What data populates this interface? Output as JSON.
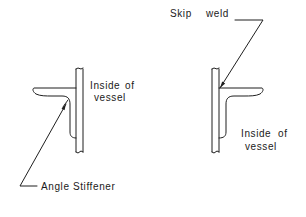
{
  "diagram": {
    "left_detail": {
      "label_inside": [
        "Inside",
        "of"
      ],
      "label_vessel": "vessel",
      "callout": "Angle Stiffener"
    },
    "right_detail": {
      "callout": "Skip",
      "callout_2": "weld",
      "label_inside": [
        "Inside",
        "of"
      ],
      "label_vessel": "vessel"
    },
    "colors": {
      "line": "#1f1f1f",
      "background": "#ffffff"
    }
  }
}
